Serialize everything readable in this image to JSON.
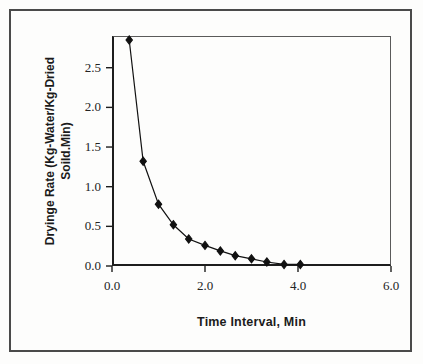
{
  "chart_data": {
    "type": "line",
    "title": "",
    "xlabel": "Time Interval, Min",
    "ylabel_line1": "Dryinge Rate (Kg-Water/Kg-Dried",
    "ylabel_line2": "Soild.Min)",
    "xlim": [
      0.0,
      6.0
    ],
    "ylim": [
      0.0,
      2.9
    ],
    "xticks": [
      "0.0",
      "2.0",
      "4.0",
      "6.0"
    ],
    "xtick_values": [
      0.0,
      2.0,
      4.0,
      6.0
    ],
    "yticks": [
      "0.0",
      "0.5",
      "1.0",
      "1.5",
      "2.0",
      "2.5"
    ],
    "ytick_values": [
      0.0,
      0.5,
      1.0,
      1.5,
      2.0,
      2.5
    ],
    "grid": false,
    "legend": null,
    "marker": "filled-diamond",
    "marker_color": "#111111",
    "line_color": "#111111",
    "x": [
      0.37,
      0.67,
      1.0,
      1.32,
      1.65,
      2.0,
      2.33,
      2.65,
      3.0,
      3.33,
      3.7,
      4.05
    ],
    "y": [
      2.85,
      1.32,
      0.78,
      0.52,
      0.34,
      0.26,
      0.19,
      0.13,
      0.09,
      0.05,
      0.02,
      0.02
    ],
    "series": [
      {
        "name": "Drying rate",
        "points": [
          {
            "x": 0.37,
            "y": 2.85
          },
          {
            "x": 0.67,
            "y": 1.32
          },
          {
            "x": 1.0,
            "y": 0.78
          },
          {
            "x": 1.32,
            "y": 0.52
          },
          {
            "x": 1.65,
            "y": 0.34
          },
          {
            "x": 2.0,
            "y": 0.26
          },
          {
            "x": 2.33,
            "y": 0.19
          },
          {
            "x": 2.65,
            "y": 0.13
          },
          {
            "x": 3.0,
            "y": 0.09
          },
          {
            "x": 3.33,
            "y": 0.05
          },
          {
            "x": 3.7,
            "y": 0.02
          },
          {
            "x": 4.05,
            "y": 0.02
          }
        ]
      }
    ]
  }
}
